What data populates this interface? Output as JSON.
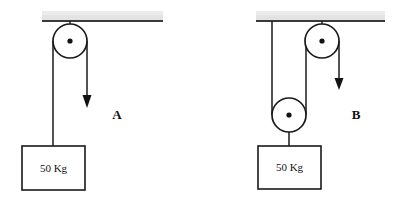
{
  "figure": {
    "background_color": "#ffffff",
    "line_color": "#1a1a1a",
    "ceiling_fill": "#e3e3e3",
    "ceiling_edge_color": "#3a3a3a",
    "width": 393,
    "height": 199
  },
  "systems": [
    {
      "id": "system-a",
      "label": "A",
      "label_x": 117,
      "label_y": 119,
      "description": "Single fixed pulley",
      "ceiling": {
        "x": 42,
        "y": 11,
        "width": 121,
        "height": 10
      },
      "pulleys": [
        {
          "name": "fixed-pulley",
          "cx": 70,
          "cy": 41,
          "r": 17,
          "hub_r": 2.6,
          "type": "fixed"
        }
      ],
      "hanger_rod": {
        "x": 70,
        "y1": 21,
        "y2": 41
      },
      "ropes": [
        {
          "name": "load-rope",
          "x": 53,
          "y1": 41,
          "y2": 146
        },
        {
          "name": "pull-rope",
          "x": 87,
          "y1": 41,
          "y2": 95
        }
      ],
      "arrow": {
        "name": "pull-direction-arrow",
        "x": 87,
        "tip_y": 108,
        "head_top_y": 95,
        "head_half_width": 4.5,
        "direction": "down"
      },
      "load": {
        "name": "mass-block",
        "text": "50 Kg",
        "x": 22,
        "y": 146,
        "width": 63,
        "height": 44,
        "text_x": 53.5,
        "text_y": 172,
        "attach_x": 53
      }
    },
    {
      "id": "system-b",
      "label": "B",
      "label_x": 356,
      "label_y": 119,
      "description": "Fixed pulley with movable pulley",
      "ceiling": {
        "x": 256,
        "y": 11,
        "width": 129,
        "height": 10
      },
      "pulleys": [
        {
          "name": "fixed-pulley",
          "cx": 322,
          "cy": 41,
          "r": 17,
          "hub_r": 2.6,
          "type": "fixed"
        },
        {
          "name": "movable-pulley",
          "cx": 289,
          "cy": 115,
          "r": 17,
          "hub_r": 2.6,
          "type": "movable"
        }
      ],
      "hanger_rod": {
        "x": 322,
        "y1": 21,
        "y2": 41
      },
      "ropes": [
        {
          "name": "anchor-rope",
          "x": 272,
          "y1": 21,
          "y2": 115
        },
        {
          "name": "connecting-rope",
          "x": 306,
          "y1": 41,
          "y2": 115
        },
        {
          "name": "pull-rope",
          "x": 339,
          "y1": 41,
          "y2": 78
        },
        {
          "name": "load-hanger",
          "x": 289,
          "y1": 132,
          "y2": 146
        }
      ],
      "arrow": {
        "name": "pull-direction-arrow",
        "x": 339,
        "tip_y": 90,
        "head_top_y": 78,
        "head_half_width": 4.5,
        "direction": "down"
      },
      "load": {
        "name": "mass-block",
        "text": "50 Kg",
        "x": 258,
        "y": 146,
        "width": 63,
        "height": 43,
        "text_x": 289.5,
        "text_y": 171,
        "attach_x": 289
      }
    }
  ]
}
